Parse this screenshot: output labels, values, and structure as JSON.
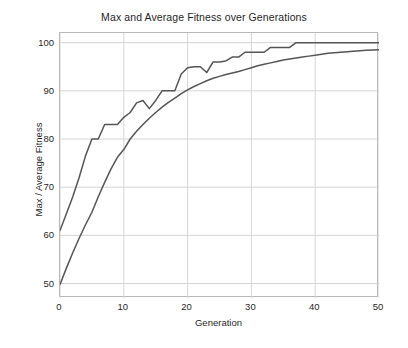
{
  "chart_data": {
    "type": "line",
    "title": "Max and Average Fitness over Generations",
    "xlabel": "Generation",
    "ylabel": "Max / Average Fitness",
    "xlim": [
      0,
      50
    ],
    "ylim": [
      47,
      102
    ],
    "xticks": [
      0,
      10,
      20,
      30,
      40,
      50
    ],
    "yticks": [
      50,
      60,
      70,
      80,
      90,
      100
    ],
    "grid": true,
    "legend": "none",
    "line_color": "#555555",
    "grid_color": "#d5d5d5",
    "axes_color": "#b8b8b8",
    "x": [
      0,
      1,
      2,
      3,
      4,
      5,
      6,
      7,
      8,
      9,
      10,
      11,
      12,
      13,
      14,
      15,
      16,
      17,
      18,
      19,
      20,
      21,
      22,
      23,
      24,
      25,
      26,
      27,
      28,
      29,
      30,
      31,
      32,
      33,
      34,
      35,
      36,
      37,
      38,
      39,
      40,
      41,
      42,
      43,
      44,
      45,
      46,
      47,
      48,
      49,
      50
    ],
    "series": [
      {
        "name": "Max Fitness",
        "values": [
          61.0,
          64.5,
          68.0,
          72.0,
          76.5,
          80.0,
          80.0,
          83.0,
          83.0,
          83.0,
          84.5,
          85.5,
          87.5,
          88.0,
          86.3,
          88.0,
          90.0,
          90.0,
          90.0,
          93.5,
          94.8,
          95.0,
          95.0,
          93.8,
          96.0,
          96.0,
          96.2,
          97.0,
          97.0,
          98.0,
          98.0,
          98.0,
          98.0,
          99.0,
          99.0,
          99.0,
          99.0,
          100.0,
          100.0,
          100.0,
          100.0,
          100.0,
          100.0,
          100.0,
          100.0,
          100.0,
          100.0,
          100.0,
          100.0,
          100.0,
          100.0
        ]
      },
      {
        "name": "Average Fitness",
        "values": [
          49.8,
          53.2,
          56.4,
          59.4,
          62.2,
          64.8,
          68.0,
          71.0,
          73.8,
          76.2,
          77.8,
          80.0,
          81.6,
          83.0,
          84.3,
          85.5,
          86.6,
          87.6,
          88.5,
          89.4,
          90.2,
          90.9,
          91.5,
          92.1,
          92.6,
          93.0,
          93.4,
          93.7,
          94.0,
          94.4,
          94.8,
          95.2,
          95.5,
          95.8,
          96.1,
          96.4,
          96.6,
          96.8,
          97.0,
          97.2,
          97.4,
          97.6,
          97.8,
          97.9,
          98.0,
          98.1,
          98.2,
          98.3,
          98.4,
          98.45,
          98.5
        ]
      }
    ]
  }
}
